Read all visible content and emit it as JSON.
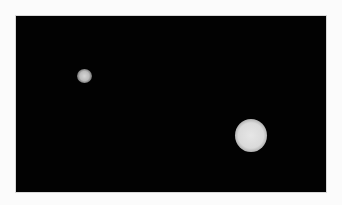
{
  "image": {
    "description": "Two bright circular spots on a black background inside a thin light border",
    "background_color": "#020202",
    "border_color": "#fbfbfb",
    "spots": [
      {
        "name": "small-spot",
        "center_x": 83,
        "center_y": 75,
        "diameter": 15,
        "color": "#cccccc"
      },
      {
        "name": "large-spot",
        "center_x": 250,
        "center_y": 135,
        "diameter": 32,
        "color": "#e0e0e0"
      }
    ]
  }
}
